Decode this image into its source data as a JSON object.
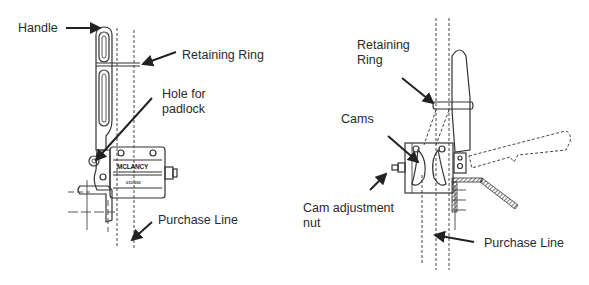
{
  "left_diagram": {
    "device_brand": "MCLANCY",
    "device_model": "010-000",
    "labels": {
      "handle": "Handle",
      "retaining_ring": "Retaining Ring",
      "hole_for_padlock": "Hole for\npadlock",
      "purchase_line": "Purchase Line"
    }
  },
  "right_diagram": {
    "labels": {
      "retaining_ring": "Retaining\nRing",
      "cams": "Cams",
      "cam_adjustment_nut": "Cam adjustment\nnut",
      "purchase_line": "Purchase Line"
    }
  },
  "colors": {
    "background": "#ffffff",
    "line": "#333333",
    "text": "#2a2a2a"
  }
}
